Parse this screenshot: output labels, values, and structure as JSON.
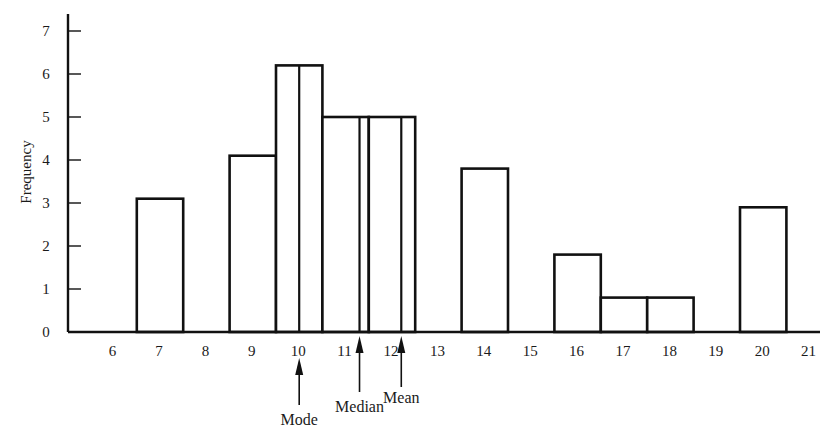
{
  "chart_data": {
    "type": "bar",
    "subtype": "histogram",
    "title": "",
    "xlabel": "",
    "ylabel": "Frequency",
    "xlim": [
      5.5,
      21.3
    ],
    "ylim": [
      0,
      7.3
    ],
    "grid": false,
    "legend": null,
    "x_ticks": [
      6,
      7,
      8,
      9,
      10,
      11,
      12,
      13,
      14,
      15,
      16,
      17,
      18,
      19,
      20,
      21
    ],
    "y_ticks": [
      0,
      1,
      2,
      3,
      4,
      5,
      6,
      7
    ],
    "categories": [
      "7",
      "9",
      "10",
      "11",
      "12",
      "14",
      "16",
      "17",
      "18",
      "20"
    ],
    "values": [
      3.1,
      4.1,
      6.2,
      5.0,
      5.0,
      3.8,
      1.8,
      0.8,
      0.8,
      2.9
    ],
    "bars": [
      {
        "x": 7,
        "height": 3.1
      },
      {
        "x": 9,
        "height": 4.1
      },
      {
        "x": 10,
        "height": 6.2,
        "divider_at": 10
      },
      {
        "x": 11,
        "height": 5.0,
        "divider_at": 11.3
      },
      {
        "x": 12,
        "height": 5.0,
        "divider_at": 12.2
      },
      {
        "x": 14,
        "height": 3.8
      },
      {
        "x": 16,
        "height": 1.8
      },
      {
        "x": 17,
        "height": 0.8
      },
      {
        "x": 18,
        "height": 0.8
      },
      {
        "x": 20,
        "height": 2.9
      }
    ],
    "annotations": [
      {
        "label": "Mode",
        "x": 10.0,
        "type": "arrow-up"
      },
      {
        "label": "Median",
        "x": 11.3,
        "type": "arrow-up"
      },
      {
        "label": "Mean",
        "x": 12.2,
        "type": "arrow-up"
      }
    ]
  },
  "layout": {
    "x_origin_px": 68,
    "baseline_px": 332,
    "x_axis_end_px": 820,
    "y_axis_top_px": 14,
    "px_per_x": 46.4,
    "x_ref_value": 7,
    "x_ref_px": 160,
    "px_per_y": 43.0
  }
}
